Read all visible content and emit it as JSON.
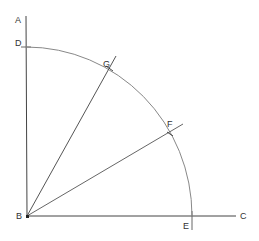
{
  "diagram": {
    "type": "geometric-construction",
    "colors": {
      "stroke": "#444444",
      "arc": "#888888",
      "label": "#333333"
    },
    "points": {
      "A": {
        "label": "A",
        "x": 26,
        "y": 16
      },
      "B": {
        "label": "B",
        "x": 27,
        "y": 216
      },
      "C": {
        "label": "C",
        "x": 236,
        "y": 216
      },
      "D": {
        "label": "D",
        "x": 26,
        "y": 47
      },
      "E": {
        "label": "E",
        "x": 192,
        "y": 216
      },
      "F": {
        "label": "F",
        "x": 171,
        "y": 131
      },
      "G": {
        "label": "G",
        "x": 110,
        "y": 66
      }
    },
    "labels": [
      {
        "text": "A",
        "x": 15,
        "y": 23
      },
      {
        "text": "D",
        "x": 15,
        "y": 46
      },
      {
        "text": "G",
        "x": 103,
        "y": 67
      },
      {
        "text": "F",
        "x": 167,
        "y": 127
      },
      {
        "text": "B",
        "x": 16,
        "y": 219
      },
      {
        "text": "E",
        "x": 183,
        "y": 229
      },
      {
        "text": "C",
        "x": 240,
        "y": 219
      }
    ]
  }
}
